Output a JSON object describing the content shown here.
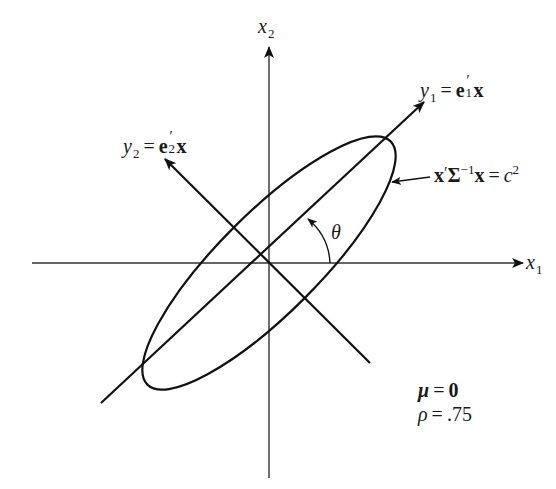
{
  "diagram": {
    "type": "rotated-ellipse-coordinate-axes",
    "axes": {
      "x1": {
        "base": "x",
        "subscript": "1"
      },
      "x2": {
        "base": "x",
        "subscript": "2"
      }
    },
    "principal_axes": {
      "y1": {
        "base": "y",
        "subscript": "1",
        "equals": "=",
        "vector": "e",
        "prime": "′",
        "vector_subscript": "1",
        "variable": "x"
      },
      "y2": {
        "base": "y",
        "subscript": "2",
        "equals": "=",
        "vector": "e",
        "prime": "′",
        "vector_subscript": "2",
        "variable": "x"
      }
    },
    "ellipse_label": {
      "lhs_x": "x",
      "prime": "′",
      "sigma": "Σ",
      "sigma_exp": "−1",
      "rhs_x": "x",
      "equals": "=",
      "c": "c",
      "c_exp": "2"
    },
    "angle_label": "θ",
    "parameters": {
      "mu": {
        "symbol": "μ",
        "equals": "=",
        "value": "0"
      },
      "rho": {
        "symbol": "ρ",
        "equals": "=",
        "value": ".75"
      }
    },
    "colors": {
      "stroke": "#111111",
      "background": "#ffffff"
    }
  }
}
